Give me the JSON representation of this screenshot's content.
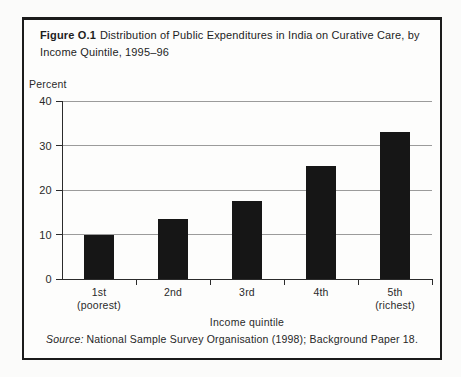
{
  "figure": {
    "label": "Figure O.1",
    "title": "Distribution of Public Expenditures in India on Curative Care, by Income Quintile, 1995–96",
    "source_prefix": "Source:",
    "source_text": "National Sample Survey Organisation (1998); Background Paper 18."
  },
  "chart_data": {
    "type": "bar",
    "categories": [
      "1st (poorest)",
      "2nd",
      "3rd",
      "4th",
      "5th (richest)"
    ],
    "category_lines": [
      [
        "1st",
        "(poorest)"
      ],
      [
        "2nd"
      ],
      [
        "3rd"
      ],
      [
        "4th"
      ],
      [
        "5th",
        "(richest)"
      ]
    ],
    "values": [
      10,
      13.5,
      17.5,
      25.5,
      33
    ],
    "ylabel": "Percent",
    "xlabel": "Income quintile",
    "ylim": [
      0,
      40
    ],
    "yticks": [
      0,
      10,
      20,
      30,
      40
    ],
    "grid": true,
    "legend_position": "none",
    "bar_color": "#161616",
    "gridline_color": "#9b9b9b",
    "axis_color": "#2b2b2b"
  }
}
